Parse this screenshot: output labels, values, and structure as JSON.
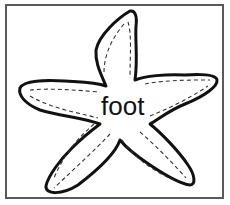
{
  "illustration": {
    "subject": "starfish-outline",
    "label": "foot",
    "colors": {
      "outline": "#111111",
      "frame": "#5a5a5a",
      "background": "#ffffff"
    }
  }
}
